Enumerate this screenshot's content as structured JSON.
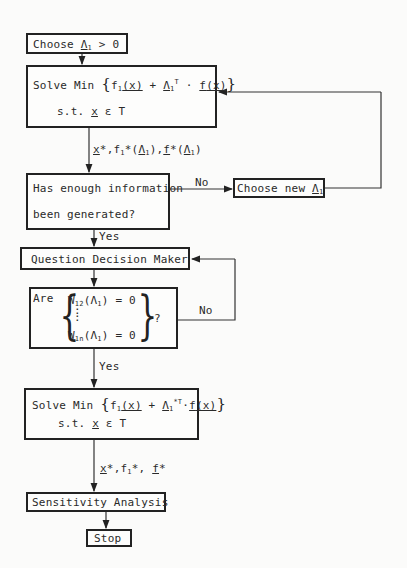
{
  "diagram": {
    "type": "flowchart",
    "nodes": {
      "choose_lambda": {
        "text_pre": "Choose ",
        "lambda": "Λ",
        "sub": "1",
        "text_post": " > 0"
      },
      "solve_min_1": {
        "line1_pre": "Solve Min ",
        "f1": "f",
        "f1_sub": "1",
        "x1": "(x)",
        "plus": " + ",
        "lambda": "Λ",
        "lambda_sub": "1",
        "lambda_sup": "T",
        "dot": " · ",
        "fvec": "f",
        "x2": "(x)",
        "line2": "s.t. ",
        "x": "x",
        "in_T": " ε T"
      },
      "enough_info": {
        "line1": "Has enough information",
        "line2": "been generated?"
      },
      "choose_new_lambda": {
        "text_pre": "Choose new ",
        "lambda": "Λ",
        "sub": "1"
      },
      "question_dm": {
        "text": "Question Decision Maker"
      },
      "are_w_zero": {
        "are": "Are",
        "row1": "W",
        "row1_sub": "12",
        "row1_arg": "(Λ",
        "row1_arg_sub": "1",
        "row1_end": ") = 0",
        "dots": ":",
        "rown": "W",
        "rown_sub": "1n",
        "rown_arg": "(Λ",
        "rown_arg_sub": "1",
        "rown_end": ") = 0",
        "q": "?"
      },
      "solve_min_2": {
        "line1_pre": "Solve Min ",
        "f1": "f",
        "f1_sub": "1",
        "x1": "(x)",
        "plus": " + ",
        "lambda": "Λ",
        "lambda_sub": "1",
        "lambda_sup": "*T",
        "dot": "·",
        "fvec": "f",
        "x2": "(x)",
        "line2": "s.t. ",
        "x": "x",
        "in_T": " ε T"
      },
      "sensitivity": {
        "text": "Sensitivity Analysis"
      },
      "stop": {
        "text": "Stop"
      }
    },
    "edge_labels": {
      "after_solve1": {
        "x": "x",
        "star1": "*,f",
        "f1_sub": "1",
        "star2": "*(",
        "lam": "Λ",
        "lam_sub": "1",
        "mid": "),",
        "f": "f",
        "star3": "*(",
        "lam2": "Λ",
        "lam2_sub": "1",
        "end": ")"
      },
      "no_1": "No",
      "yes_1": "Yes",
      "no_2": "No",
      "yes_2": "Yes",
      "after_solve2": {
        "x": "x",
        "mid": "*,f",
        "f1_sub": "1",
        "mid2": "*, ",
        "f": "f",
        "end": "*"
      }
    }
  }
}
